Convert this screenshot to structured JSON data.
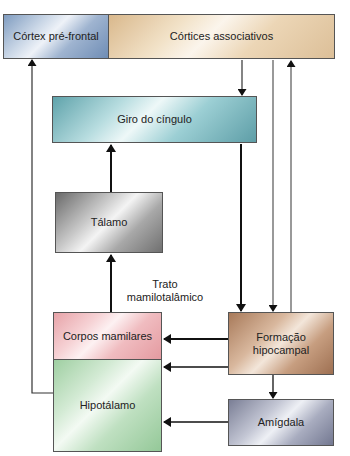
{
  "diagram": {
    "nodes": {
      "cortex_prefrontal": "Córtex pré-frontal",
      "cortices_associativos": "Córtices associativos",
      "giro_do_cingulo": "Giro do cíngulo",
      "talamo": "Tálamo",
      "corpos_mamilares": "Corpos mamilares",
      "hipotalamo": "Hipotálamo",
      "formacao_hipocampal_line1": "Formação",
      "formacao_hipocampal_line2": "hipocampal",
      "amigdala": "Amígdala"
    },
    "edge_labels": {
      "trato_line1": "Trato",
      "trato_line2": "mamilotalâmico"
    },
    "edges": [
      {
        "from": "Córtices associativos",
        "to": "Giro do cíngulo"
      },
      {
        "from": "Córtices associativos",
        "to": "Formação hipocampal"
      },
      {
        "from": "Formação hipocampal",
        "to": "Córtices associativos"
      },
      {
        "from": "Giro do cíngulo",
        "to": "Formação hipocampal"
      },
      {
        "from": "Tálamo",
        "to": "Giro do cíngulo"
      },
      {
        "from": "Corpos mamilares",
        "to": "Tálamo",
        "label": "Trato mamilotalâmico"
      },
      {
        "from": "Formação hipocampal",
        "to": "Corpos mamilares"
      },
      {
        "from": "Formação hipocampal",
        "to": "Hipotálamo"
      },
      {
        "from": "Formação hipocampal",
        "to": "Amígdala"
      },
      {
        "from": "Amígdala",
        "to": "Hipotálamo"
      },
      {
        "from": "Hipotálamo",
        "to": "Córtex pré-frontal"
      }
    ]
  }
}
